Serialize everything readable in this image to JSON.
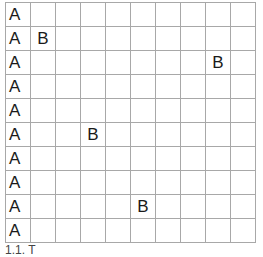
{
  "grid": {
    "rows": 10,
    "cols": 10,
    "cells": [
      [
        "A",
        "",
        "",
        "",
        "",
        "",
        "",
        "",
        "",
        ""
      ],
      [
        "A",
        "B",
        "",
        "",
        "",
        "",
        "",
        "",
        "",
        ""
      ],
      [
        "A",
        "",
        "",
        "",
        "",
        "",
        "",
        "",
        "B",
        ""
      ],
      [
        "A",
        "",
        "",
        "",
        "",
        "",
        "",
        "",
        "",
        ""
      ],
      [
        "A",
        "",
        "",
        "",
        "",
        "",
        "",
        "",
        "",
        ""
      ],
      [
        "A",
        "",
        "",
        "B",
        "",
        "",
        "",
        "",
        "",
        ""
      ],
      [
        "A",
        "",
        "",
        "",
        "",
        "",
        "",
        "",
        "",
        ""
      ],
      [
        "A",
        "",
        "",
        "",
        "",
        "",
        "",
        "",
        "",
        ""
      ],
      [
        "A",
        "",
        "",
        "",
        "",
        "B",
        "",
        "",
        "",
        ""
      ],
      [
        "A",
        "",
        "",
        "",
        "",
        "",
        "",
        "",
        "",
        ""
      ]
    ],
    "line_color": "#a8a8a8"
  },
  "caption": {
    "text": "1.1. T"
  }
}
